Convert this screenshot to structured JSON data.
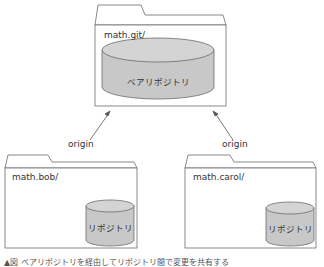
{
  "diagram": {
    "top_folder": {
      "label": "math.git/",
      "repo_label": "ベアリポジトリ"
    },
    "left_folder": {
      "label": "math.bob/",
      "repo_label": "リポジトリ"
    },
    "right_folder": {
      "label": "math.carol/",
      "repo_label": "リポジトリ"
    },
    "arrows": [
      {
        "from": "left_folder",
        "to": "top_folder",
        "label": "origin"
      },
      {
        "from": "right_folder",
        "to": "top_folder",
        "label": "origin"
      }
    ],
    "caption": "▲図 ベアリポジトリを経由してリポジトリ間で変更を共有する"
  },
  "colors": {
    "line": "#6b6b6b",
    "cylinder_fill": "#c8c8c8",
    "cylinder_top": "#d4d4d4"
  }
}
